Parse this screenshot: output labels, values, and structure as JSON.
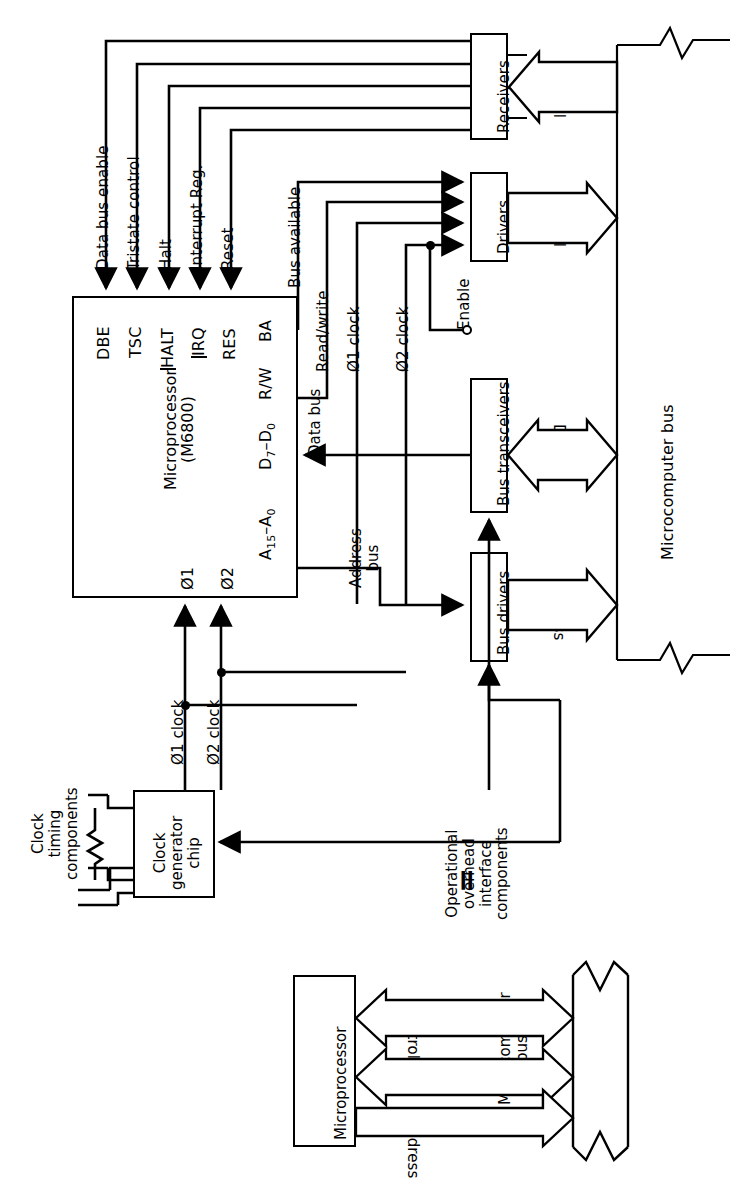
{
  "figure": {
    "type": "block-diagram",
    "orientation": "rotated-90-ccw"
  },
  "top_diagram": {
    "cpu_box": {
      "name": "Microprocessor",
      "part": "(M6800)",
      "pins_top": [
        "DBE",
        "TSC",
        "HALT",
        "IRQ",
        "RES",
        "BA"
      ],
      "pins_right": [
        "R/W",
        "D7-D0",
        "A15-A0"
      ],
      "pins_bottom": [
        "Ø1",
        "Ø2"
      ]
    },
    "signal_labels": {
      "data_bus_enable": "Data bus enable",
      "tristate_control": "Tristate control",
      "halt": "Halt",
      "interrupt_reg": "Interrupt Reg.",
      "reset": "Reset",
      "bus_available": "Bus available",
      "read_write": "Read/write",
      "phi1_clock": "Ø1 clock",
      "phi2_clock": "Ø2 clock",
      "data_bus": "Data bus",
      "address_bus": "Address bus",
      "enable": "Enable"
    },
    "blocks": {
      "receivers": "Receivers",
      "drivers": "Drivers",
      "bus_transceivers": "Bus transceivers",
      "bus_drivers": "Bus drivers",
      "clock_generator": "Clock generator chip"
    },
    "bus_arrows": {
      "control_in": "Control",
      "control_out": "Control",
      "data": "Data",
      "address": "Address"
    },
    "microcomputer_bus": "Microcomputer bus",
    "annotations": {
      "clock_timing": "Clock timing components",
      "operational_overhead": "Operational overhead interface components"
    },
    "clock_gen_lines": [
      "Clock",
      "generator",
      "chip"
    ],
    "clock_timing_lines": [
      "Clock",
      "timing",
      "components"
    ],
    "overhead_lines": [
      "Operational",
      "overhead",
      "interface",
      "components"
    ]
  },
  "equivalence_symbol": "=",
  "bottom_diagram": {
    "left_block": "Microprocessor",
    "right_block_lines": [
      "Microcomputer",
      "bus"
    ],
    "right_block": "Microcomputer bus",
    "arrows": [
      {
        "label": "Control",
        "direction": "bidirectional"
      },
      {
        "label": "Data",
        "direction": "bidirectional"
      },
      {
        "label": "Address",
        "direction": "unidirectional"
      }
    ]
  },
  "colors": {
    "ink": "#000000",
    "paper": "#ffffff"
  }
}
